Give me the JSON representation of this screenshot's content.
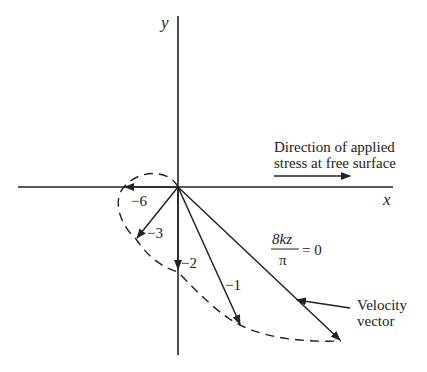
{
  "diagram": {
    "type": "velocity vector spiral (Ekman spiral)",
    "axes": {
      "x_label": "x",
      "y_label": "y"
    },
    "annotation_stress": {
      "line1": "Direction of applied",
      "line2": "stress at free surface"
    },
    "equation": {
      "numerator": "8kz",
      "denominator": "π",
      "rhs": "= 0"
    },
    "callout": {
      "line1": "Velocity",
      "line2": "vector"
    },
    "vectors": [
      {
        "label": "8kz/π = 0",
        "tip": [
          341,
          341
        ]
      },
      {
        "label": "−1",
        "tip": [
          240,
          325
        ]
      },
      {
        "label": "−2",
        "tip": [
          178,
          270
        ]
      },
      {
        "label": "−3",
        "tip": [
          136,
          239
        ]
      },
      {
        "label": "−6",
        "tip": [
          124,
          187
        ]
      }
    ],
    "vector_labels": {
      "m1": "−1",
      "m2": "−2",
      "m3": "−3",
      "m6": "−6"
    },
    "colors": {
      "ink": "#222222",
      "background": "#ffffff"
    }
  }
}
